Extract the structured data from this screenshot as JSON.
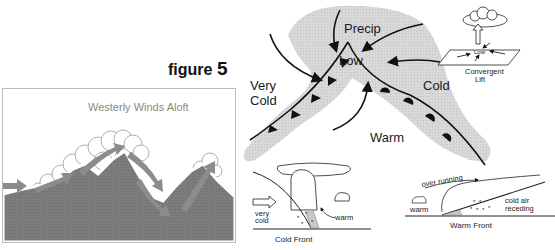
{
  "figure_title": {
    "prefix": "figure",
    "number": "5"
  },
  "left_panel": {
    "title": "Westerly Winds Aloft",
    "colors": {
      "mountain": "#7a7a7a",
      "arrow": "#8a8a8a",
      "cloud": "#ffffff"
    }
  },
  "cyclone_map": {
    "labels": {
      "precip": "Precip",
      "low": "Low",
      "very_cold_line1": "Very",
      "very_cold_line2": "Cold",
      "cold": "Cold",
      "warm": "Warm"
    },
    "colors": {
      "cold_region": "#d6d6d6",
      "front_line": "#111111"
    }
  },
  "convergent_lift": {
    "low_label": "Low",
    "caption_line1": "Convergent",
    "caption_line2": "Lift"
  },
  "cold_front_inset": {
    "very_line1": "very",
    "very_line2": "cold",
    "warm_label": "warm",
    "caption": "Cold Front"
  },
  "warm_front_inset": {
    "over_running": "over running",
    "warm_label": "warm",
    "cold_air_line1": "cold air",
    "cold_air_line2": "receding",
    "caption": "Warm Front"
  }
}
